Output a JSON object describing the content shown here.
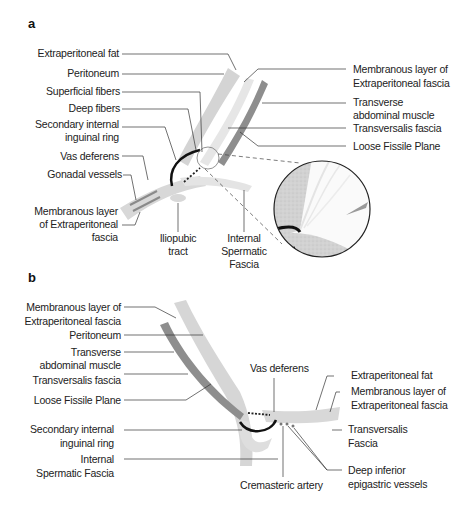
{
  "figure": {
    "panels": [
      {
        "letter": "a",
        "labels": {
          "extraperitoneal_fat": "Extraperitoneal fat",
          "peritoneum": "Peritoneum",
          "superficial_fibers": "Superficial fibers",
          "deep_fibers": "Deep fibers",
          "secondary_ring_1": "Secondary internal",
          "secondary_ring_2": "inguinal ring",
          "vas_deferens": "Vas deferens",
          "gonadal_vessels": "Gonadal vessels",
          "membranous_left_1": "Membranous layer",
          "membranous_left_2": "of Extraperitoneal",
          "membranous_left_3": "fascia",
          "iliopubic_1": "Iliopubic",
          "iliopubic_2": "tract",
          "isf_1": "Internal",
          "isf_2": "Spermatic",
          "isf_3": "Fascia",
          "membranous_right_1": "Membranous layer of",
          "membranous_right_2": "Extraperitoneal fascia",
          "transverse_1": "Transverse",
          "transverse_2": "abdominal muscle",
          "transversalis": "Transversalis fascia",
          "loose_plane": "Loose Fissile Plane"
        }
      },
      {
        "letter": "b",
        "labels": {
          "membranous_1": "Membranous layer of",
          "membranous_2": "Extraperitoneal fascia",
          "peritoneum": "Peritoneum",
          "transverse_1": "Transverse",
          "transverse_2": "abdominal muscle",
          "transversalis": "Transversalis fascia",
          "loose_plane": "Loose Fissile Plane",
          "secondary_ring_1": "Secondary internal",
          "secondary_ring_2": "inguinal ring",
          "isf_1": "Internal",
          "isf_2": "Spermatic Fascia",
          "vas_deferens": "Vas deferens",
          "extraperitoneal_fat": "Extraperitoneal fat",
          "membranous_right_1": "Membranous layer of",
          "membranous_right_2": "Extraperitoneal fascia",
          "transversalis_right_1": "Transversalis",
          "transversalis_right_2": "Fascia",
          "deep_inferior_1": "Deep inferior",
          "deep_inferior_2": "epigastric vessels",
          "cremasteric": "Cremasteric artery"
        }
      }
    ],
    "colors": {
      "fascia_light": "#d6d6d6",
      "muscle_dark": "#8c8c8c",
      "ring_black": "#111111",
      "leader": "#333333"
    }
  }
}
